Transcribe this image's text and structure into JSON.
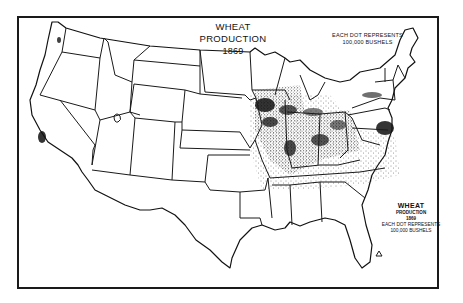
{
  "map": {
    "title": "WHEAT PRODUCTION",
    "year": "1869",
    "subject": "United States wheat production dot-density map",
    "legend_top": {
      "line1": "EACH DOT REPRESENTS",
      "line2": "100,000 BUSHELS"
    },
    "legend_inset": {
      "title": "WHEAT",
      "subtitle": "PRODUCTION",
      "year": "1869",
      "line1": "EACH DOT REPRESENTS",
      "line2": "100,000 BUSHELS"
    },
    "dot_value_bushels": 100000,
    "colors": {
      "ink": "#111111",
      "paper": "#ffffff"
    },
    "dense_regions": [
      "Southern Wisconsin",
      "Northern Illinois",
      "Iowa (eastern)",
      "Indiana",
      "Ohio",
      "Southern Michigan",
      "Pennsylvania (southeast)",
      "Maryland",
      "Western New York",
      "Central California",
      "Missouri (eastern)"
    ],
    "sparse_regions": [
      "Kansas (eastern)",
      "Nebraska (eastern)",
      "Kentucky",
      "Tennessee",
      "Virginia",
      "North Carolina",
      "Oregon (Willamette Valley)",
      "Utah (Salt Lake)"
    ]
  }
}
